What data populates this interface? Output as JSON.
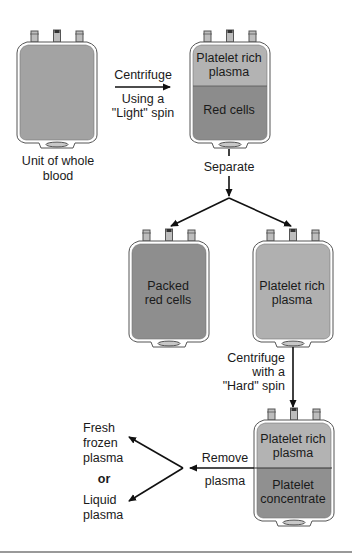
{
  "colors": {
    "background": "#ffffff",
    "bag_outline": "#555555",
    "whole_blood": "#a3a3a3",
    "plasma": "#b3b3b3",
    "red_cells": "#8c8c8c",
    "packed_red_cells": "#8e8e8e",
    "platelet_concentrate": "#909090",
    "arrow": "#111111",
    "bottom_rule": "#999999"
  },
  "bags": {
    "whole_blood": {
      "caption_line1": "Unit of whole",
      "caption_line2": "blood"
    },
    "light_spun": {
      "top_line1": "Platelet rich",
      "top_line2": "plasma",
      "bottom_line1": "Red cells"
    },
    "packed": {
      "line1": "Packed",
      "line2": "red cells"
    },
    "prp": {
      "line1": "Platelet rich",
      "line2": "plasma"
    },
    "hard_spun": {
      "top_line1": "Platelet rich",
      "top_line2": "plasma",
      "bottom_line1": "Platelet",
      "bottom_line2": "concentrate"
    }
  },
  "steps": {
    "light_spin": {
      "above": "Centrifuge",
      "below1": "Using a",
      "below2": "\"Light\" spin"
    },
    "separate": "Separate",
    "hard_spin": {
      "line1": "Centrifuge",
      "line2": "with a",
      "line3": "\"Hard\" spin"
    },
    "remove": {
      "line1": "Remove",
      "line2": "plasma"
    }
  },
  "outputs": {
    "ffp": {
      "line1": "Fresh",
      "line2": "frozen",
      "line3": "plasma"
    },
    "or": "or",
    "liquid": {
      "line1": "Liquid",
      "line2": "plasma"
    }
  }
}
